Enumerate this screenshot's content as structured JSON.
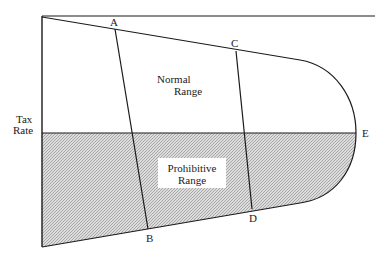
{
  "diagram": {
    "axis_label": [
      "Tax",
      "Rate"
    ],
    "regions": {
      "upper": [
        "Normal",
        "Range"
      ],
      "lower": [
        "Prohibitive",
        "Range"
      ]
    },
    "points": {
      "A": "A",
      "B": "B",
      "C": "C",
      "D": "D",
      "E": "E"
    },
    "colors": {
      "line": "#1a1a1a",
      "shade": "#c8c8c8",
      "background": "#ffffff"
    }
  }
}
